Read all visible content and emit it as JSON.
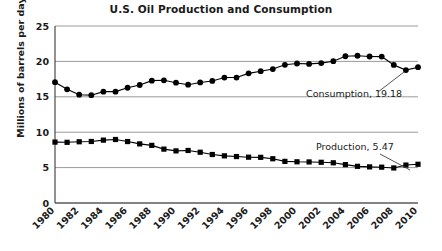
{
  "chart_data": {
    "type": "line",
    "title": "U.S. Oil Production and Consumption",
    "xlabel": "",
    "ylabel": "Millions of barrels per day",
    "ylim": [
      0,
      25
    ],
    "yticks": [
      0,
      5,
      10,
      15,
      20,
      25
    ],
    "xlim": [
      1980,
      2010
    ],
    "grid": true,
    "legend": "none (direct labels)",
    "x": [
      1980,
      1981,
      1982,
      1983,
      1984,
      1985,
      1986,
      1987,
      1988,
      1989,
      1990,
      1991,
      1992,
      1993,
      1994,
      1995,
      1996,
      1997,
      1998,
      1999,
      2000,
      2001,
      2002,
      2003,
      2004,
      2005,
      2006,
      2007,
      2008,
      2009,
      2010
    ],
    "xtick_labels": [
      "1980",
      "1982",
      "1984",
      "1986",
      "1988",
      "1990",
      "1992",
      "1994",
      "1996",
      "1998",
      "2000",
      "2002",
      "2004",
      "2006",
      "2008",
      "2010"
    ],
    "xticks": [
      1980,
      1982,
      1984,
      1986,
      1988,
      1990,
      1992,
      1994,
      1996,
      1998,
      2000,
      2002,
      2004,
      2006,
      2008,
      2010
    ],
    "series": [
      {
        "name": "Consumption",
        "marker": "circle",
        "values": [
          17.06,
          16.06,
          15.3,
          15.23,
          15.73,
          15.73,
          16.28,
          16.67,
          17.28,
          17.33,
          16.99,
          16.71,
          17.03,
          17.24,
          17.72,
          17.72,
          18.31,
          18.62,
          18.92,
          19.52,
          19.7,
          19.65,
          19.76,
          20.03,
          20.73,
          20.8,
          20.69,
          20.68,
          19.5,
          18.77,
          19.18
        ],
        "annotation": "Consumption, 19.18"
      },
      {
        "name": "Production",
        "marker": "square",
        "values": [
          8.6,
          8.57,
          8.65,
          8.69,
          8.88,
          8.97,
          8.68,
          8.35,
          8.14,
          7.61,
          7.36,
          7.42,
          7.17,
          6.85,
          6.66,
          6.56,
          6.47,
          6.45,
          6.25,
          5.88,
          5.82,
          5.8,
          5.75,
          5.68,
          5.42,
          5.18,
          5.1,
          5.06,
          4.95,
          5.36,
          5.47
        ],
        "annotation": "Production, 5.47"
      }
    ],
    "annotations": [
      {
        "text": "Consumption, 19.18",
        "value": 19.18,
        "year": 2010
      },
      {
        "text": "Production, 5.47",
        "value": 5.47,
        "year": 2010
      }
    ]
  }
}
